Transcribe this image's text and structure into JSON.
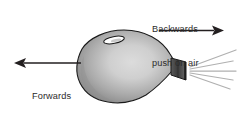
{
  "figure": {
    "kind": "physics-force-diagram",
    "background_color": "#ffffff",
    "width": 241,
    "height": 115
  },
  "labels": {
    "backwards": {
      "line1": "Backwards",
      "line2": "push on air"
    },
    "forwards": {
      "line1": "Forwards",
      "line2": "push on",
      "line3": "balloon"
    }
  },
  "arrows": {
    "backwards_arrow": {
      "direction": "right",
      "color": "#231f20"
    },
    "forwards_arrow": {
      "direction": "left",
      "color": "#231f20"
    }
  },
  "balloon": {
    "body_fill_light": "#d8d8d8",
    "body_fill_mid": "#a9a9a9",
    "body_fill_dark": "#6e6e6e",
    "outline_color": "#1a1a1a",
    "highlight_fill": "#ffffff",
    "nozzle_fill": "#4a4a4a",
    "nozzle_outline": "#1a1a1a"
  },
  "air_stream": {
    "line_color": "#b0b0b0",
    "line_count": 5
  },
  "text_color": "#2b2b2b"
}
